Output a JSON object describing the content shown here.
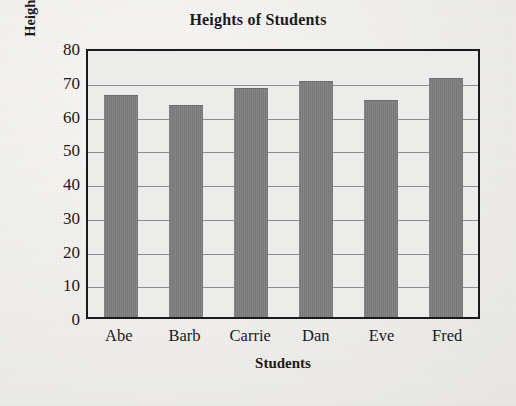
{
  "chart_data": {
    "type": "bar",
    "title": "Heights of Students",
    "xlabel": "Students",
    "ylabel": "Height in Inches",
    "categories": [
      "Abe",
      "Barb",
      "Carrie",
      "Dan",
      "Eve",
      "Fred"
    ],
    "values": [
      65.5,
      62.5,
      67.5,
      69.5,
      64,
      70.5
    ],
    "ylim": [
      0,
      80
    ],
    "ytick_labels": [
      "0",
      "10",
      "20",
      "30",
      "40",
      "50",
      "60",
      "70",
      "80"
    ],
    "ytick_values": [
      0,
      10,
      20,
      30,
      40,
      50,
      60,
      70,
      80
    ],
    "grid": true,
    "legend": "none",
    "bar_color": "#787878",
    "plot_background": "#ececeb",
    "axis_color": "#1a1a1a",
    "gridline_color": "#8d8d8d",
    "page_background": "#f0efec"
  }
}
